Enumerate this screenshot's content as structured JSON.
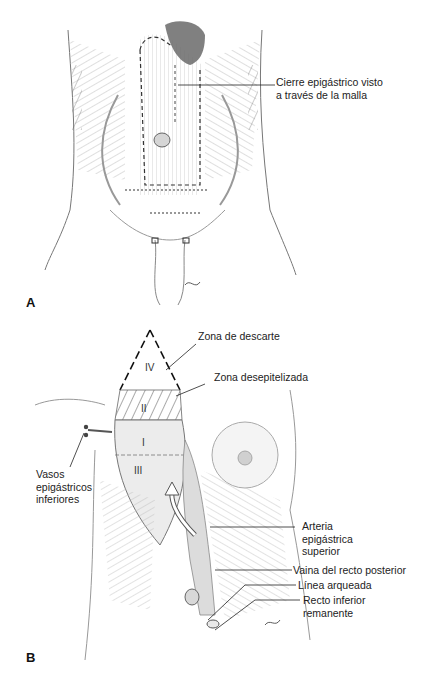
{
  "figure": {
    "panel_a": {
      "letter": "A",
      "callouts": [
        {
          "line1": "Cierre epigástrico visto",
          "line2": "a través de la malla"
        }
      ]
    },
    "panel_b": {
      "letter": "B",
      "zones": [
        "IV",
        "II",
        "I",
        "III"
      ],
      "callouts": [
        {
          "text": "Zona de descarte"
        },
        {
          "text": "Zona desepitelizada"
        },
        {
          "line1": "Vasos",
          "line2": "epigástricos",
          "line3": "inferiores"
        },
        {
          "line1": "Arteria",
          "line2": "epigástrica",
          "line3": "superior"
        },
        {
          "text": "Vaina del recto posterior"
        },
        {
          "text": "Línea arqueada"
        },
        {
          "line1": "Recto inferior",
          "line2": "remanente"
        }
      ]
    },
    "colors": {
      "background": "#ffffff",
      "line": "#222222",
      "shading": "#bdbdbd"
    }
  }
}
